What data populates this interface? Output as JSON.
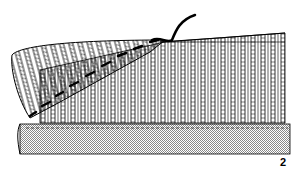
{
  "figure": {
    "label": "2",
    "elements": [
      "folded-knit-layer",
      "vertical-knit-ribs",
      "diagonal-stitch-seam",
      "yarn-tail",
      "base-fabric-dotted",
      "basting-line"
    ],
    "colors": {
      "ink": "#000000",
      "base_fabric": "#c8c8c8",
      "background": "#ffffff"
    }
  }
}
